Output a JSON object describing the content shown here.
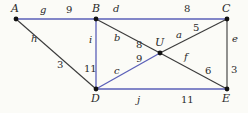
{
  "graph": {
    "colors": {
      "blue": "#5a5fb8",
      "dark": "#3a3a3a",
      "node": "#111111"
    },
    "nodes": [
      {
        "id": "A",
        "label": "A"
      },
      {
        "id": "B",
        "label": "B"
      },
      {
        "id": "C",
        "label": "C"
      },
      {
        "id": "U",
        "label": "U"
      },
      {
        "id": "D",
        "label": "D"
      },
      {
        "id": "E",
        "label": "E"
      }
    ],
    "edges": [
      {
        "id": "g",
        "from": "A",
        "to": "B",
        "name": "g",
        "weight": "9",
        "color": "blue"
      },
      {
        "id": "d",
        "from": "B",
        "to": "C",
        "name": "d",
        "weight": "8",
        "color": "blue"
      },
      {
        "id": "i",
        "from": "B",
        "to": "D",
        "name": "i",
        "weight": "11",
        "color": "blue"
      },
      {
        "id": "h",
        "from": "A",
        "to": "D",
        "name": "h",
        "weight": "3",
        "color": "dark"
      },
      {
        "id": "b",
        "from": "B",
        "to": "U",
        "name": "b",
        "weight": "8",
        "color": "dark"
      },
      {
        "id": "a",
        "from": "U",
        "to": "C",
        "name": "a",
        "weight": "5",
        "color": "dark"
      },
      {
        "id": "c",
        "from": "D",
        "to": "U",
        "name": "c",
        "weight": "9",
        "color": "blue"
      },
      {
        "id": "f",
        "from": "U",
        "to": "E",
        "name": "f",
        "weight": "6",
        "color": "dark"
      },
      {
        "id": "e",
        "from": "C",
        "to": "E",
        "name": "e",
        "weight": "3",
        "color": "dark"
      },
      {
        "id": "j",
        "from": "D",
        "to": "E",
        "name": "j",
        "weight": "11",
        "color": "blue"
      }
    ]
  }
}
